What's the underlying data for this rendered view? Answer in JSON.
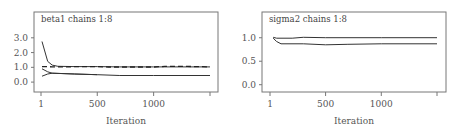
{
  "chart_data": [
    {
      "type": "line",
      "title": "beta1 chains 1:8",
      "xlabel": "Iteration",
      "ylabel": "",
      "x_ticks": [
        "1",
        "500",
        "1000"
      ],
      "y_ticks": [
        "0.0",
        "1.0",
        "2.0",
        "3.0"
      ],
      "xlim": [
        1,
        1500
      ],
      "ylim": [
        -0.4,
        3.8
      ],
      "grid": false,
      "series": [
        {
          "name": "upper",
          "style": "solid",
          "x": [
            10,
            60,
            100,
            150,
            300,
            500,
            700,
            1000,
            1500
          ],
          "values": [
            2.75,
            1.4,
            1.15,
            1.07,
            1.05,
            1.05,
            1.03,
            1.03,
            1.03
          ]
        },
        {
          "name": "median",
          "style": "dashed",
          "x": [
            10,
            60,
            100,
            300,
            500,
            600,
            1000,
            1100,
            1300,
            1500
          ],
          "values": [
            1.05,
            1.05,
            1.03,
            1.04,
            1.05,
            1.02,
            1.02,
            1.06,
            1.06,
            1.03
          ]
        },
        {
          "name": "lower",
          "style": "solid",
          "x": [
            10,
            60,
            100,
            300,
            500,
            700,
            1000,
            1500
          ],
          "values": [
            0.4,
            0.55,
            0.6,
            0.55,
            0.5,
            0.45,
            0.45,
            0.45
          ]
        },
        {
          "name": "lower2",
          "style": "solid",
          "x": [
            10,
            60,
            100,
            300,
            500
          ],
          "values": [
            0.9,
            0.7,
            0.6,
            0.55,
            0.5
          ]
        }
      ]
    },
    {
      "type": "line",
      "title": "sigma2 chains 1:8",
      "xlabel": "Iteration",
      "ylabel": "",
      "x_ticks": [
        "1",
        "500",
        "1000"
      ],
      "y_ticks": [
        "0.0",
        "0.5",
        "1.0"
      ],
      "xlim": [
        1,
        1500
      ],
      "ylim": [
        -0.07,
        1.25
      ],
      "grid": false,
      "series": [
        {
          "name": "upper",
          "style": "solid",
          "x": [
            30,
            60,
            200,
            300,
            500,
            1000,
            1500
          ],
          "values": [
            1.01,
            0.99,
            0.99,
            1.01,
            1.0,
            1.0,
            1.0
          ]
        },
        {
          "name": "lower",
          "style": "solid",
          "x": [
            30,
            60,
            100,
            300,
            500,
            700,
            1000,
            1500
          ],
          "values": [
            0.99,
            0.92,
            0.87,
            0.87,
            0.85,
            0.86,
            0.87,
            0.87
          ]
        }
      ]
    }
  ]
}
